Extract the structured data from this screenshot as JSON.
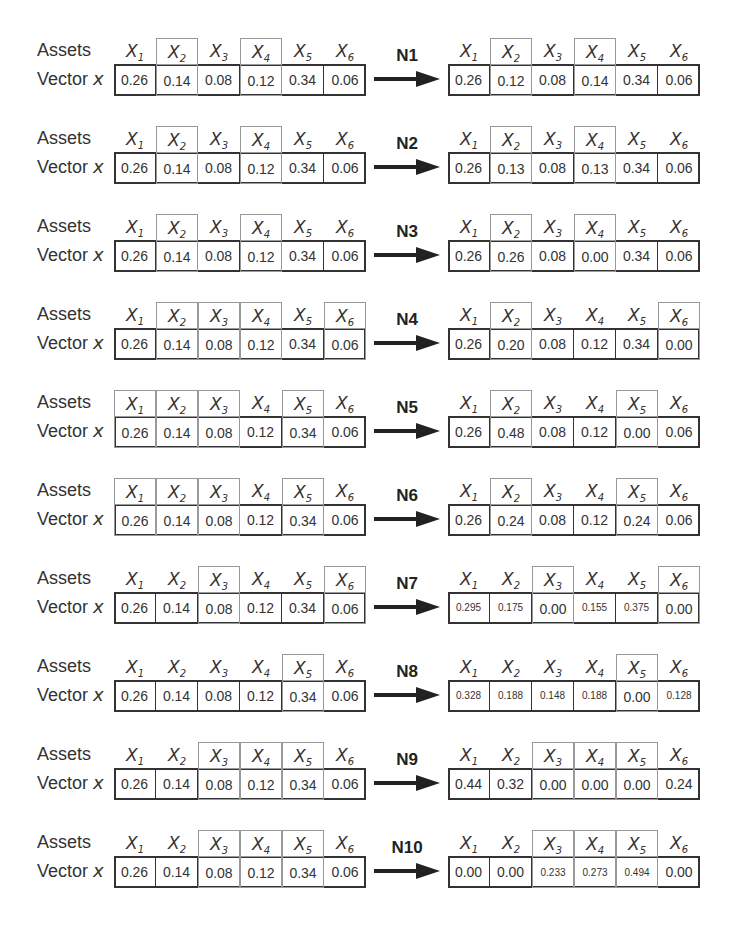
{
  "labels": {
    "assets": "Assets",
    "vector": "Vector",
    "vector_var": "x"
  },
  "asset_headers": [
    "X1",
    "X2",
    "X3",
    "X4",
    "X5",
    "X6"
  ],
  "asset_header_base": "X",
  "asset_header_subs": [
    "1",
    "2",
    "3",
    "4",
    "5",
    "5"
  ],
  "rows": [
    {
      "op": "N1",
      "before": [
        "0.26",
        "0.14",
        "0.08",
        "0.12",
        "0.34",
        "0.06"
      ],
      "after": [
        "0.26",
        "0.12",
        "0.08",
        "0.14",
        "0.34",
        "0.06"
      ],
      "left_hl": [
        1,
        3
      ],
      "right_hl": [
        1,
        3
      ]
    },
    {
      "op": "N2",
      "before": [
        "0.26",
        "0.14",
        "0.08",
        "0.12",
        "0.34",
        "0.06"
      ],
      "after": [
        "0.26",
        "0.13",
        "0.08",
        "0.13",
        "0.34",
        "0.06"
      ],
      "left_hl": [
        1,
        3
      ],
      "right_hl": [
        1,
        3
      ]
    },
    {
      "op": "N3",
      "before": [
        "0.26",
        "0.14",
        "0.08",
        "0.12",
        "0.34",
        "0.06"
      ],
      "after": [
        "0.26",
        "0.26",
        "0.08",
        "0.00",
        "0.34",
        "0.06"
      ],
      "left_hl": [
        1,
        3
      ],
      "right_hl": [
        1,
        3
      ]
    },
    {
      "op": "N4",
      "before": [
        "0.26",
        "0.14",
        "0.08",
        "0.12",
        "0.34",
        "0.06"
      ],
      "after": [
        "0.26",
        "0.20",
        "0.08",
        "0.12",
        "0.34",
        "0.00"
      ],
      "left_hl": [
        1,
        2,
        3,
        5
      ],
      "right_hl": [
        1,
        5
      ]
    },
    {
      "op": "N5",
      "before": [
        "0.26",
        "0.14",
        "0.08",
        "0.12",
        "0.34",
        "0.06"
      ],
      "after": [
        "0.26",
        "0.48",
        "0.08",
        "0.12",
        "0.00",
        "0.06"
      ],
      "left_hl": [
        0,
        1,
        2,
        4
      ],
      "right_hl": [
        1,
        4
      ]
    },
    {
      "op": "N6",
      "before": [
        "0.26",
        "0.14",
        "0.08",
        "0.12",
        "0.34",
        "0.06"
      ],
      "after": [
        "0.26",
        "0.24",
        "0.08",
        "0.12",
        "0.24",
        "0.06"
      ],
      "left_hl": [
        0,
        1,
        2,
        4
      ],
      "right_hl": [
        1,
        4
      ]
    },
    {
      "op": "N7",
      "before": [
        "0.26",
        "0.14",
        "0.08",
        "0.12",
        "0.34",
        "0.06"
      ],
      "after": [
        "0.295",
        "0.175",
        "0.00",
        "0.155",
        "0.375",
        "0.00"
      ],
      "left_hl": [
        2,
        5
      ],
      "right_hl": [
        2,
        5
      ]
    },
    {
      "op": "N8",
      "before": [
        "0.26",
        "0.14",
        "0.08",
        "0.12",
        "0.34",
        "0.06"
      ],
      "after": [
        "0.328",
        "0.188",
        "0.148",
        "0.188",
        "0.00",
        "0.128"
      ],
      "left_hl": [
        4
      ],
      "right_hl": [
        4
      ]
    },
    {
      "op": "N9",
      "before": [
        "0.26",
        "0.14",
        "0.08",
        "0.12",
        "0.34",
        "0.06"
      ],
      "after": [
        "0.44",
        "0.32",
        "0.00",
        "0.00",
        "0.00",
        "0.24"
      ],
      "left_hl": [
        2,
        3,
        4
      ],
      "right_hl": [
        2,
        3,
        4
      ]
    },
    {
      "op": "N10",
      "before": [
        "0.26",
        "0.14",
        "0.08",
        "0.12",
        "0.34",
        "0.06"
      ],
      "after": [
        "0.00",
        "0.00",
        "0.233",
        "0.273",
        "0.494",
        "0.00"
      ],
      "left_hl": [
        2,
        3,
        4
      ],
      "right_hl": [
        2,
        3,
        4
      ]
    }
  ],
  "colors": {
    "box_border": "#333333",
    "highlight_border": "#999999",
    "text": "#333333"
  }
}
